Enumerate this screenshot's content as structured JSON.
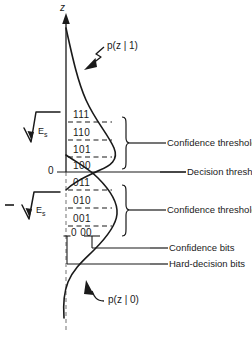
{
  "figure": {
    "axis": {
      "vertical_label": "z",
      "origin_label": "0",
      "upper_amplitude_label": "E",
      "upper_amplitude_sub": "s",
      "lower_amplitude_label": "E",
      "lower_amplitude_sub": "s",
      "lower_amplitude_sign": "−"
    },
    "curves": [
      {
        "name": "upper-density",
        "label": "p(z | 1)"
      },
      {
        "name": "lower-density",
        "label": "p(z | 0)"
      }
    ],
    "quantization_levels": [
      {
        "code": "111",
        "region": "upper"
      },
      {
        "code": "110",
        "region": "upper"
      },
      {
        "code": "101",
        "region": "upper"
      },
      {
        "code": "100",
        "region": "upper"
      },
      {
        "code": "011",
        "region": "lower"
      },
      {
        "code": "010",
        "region": "lower"
      },
      {
        "code": "001",
        "region": "lower"
      },
      {
        "code": "0 00",
        "region": "lower"
      }
    ],
    "annotations": [
      {
        "name": "confidence-threshold-upper",
        "text": "Confidence threshold"
      },
      {
        "name": "decision-threshold",
        "text": "Decision threshold"
      },
      {
        "name": "confidence-threshold-lower",
        "text": "Confidence threshold"
      },
      {
        "name": "confidence-bits",
        "text": "Confidence bits"
      },
      {
        "name": "hard-decision-bits",
        "text": "Hard-decision bits"
      }
    ],
    "colors": {
      "ink": "#1a1a1a",
      "background": "#ffffff"
    }
  }
}
